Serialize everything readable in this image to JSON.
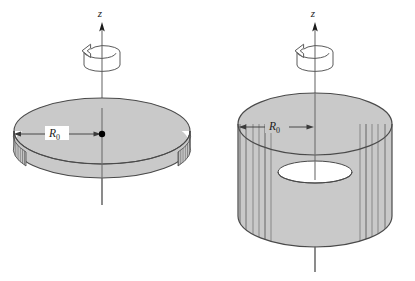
{
  "figure": {
    "kind": "technical-line-diagram",
    "background_color": "#ffffff",
    "line_color": "#3a3a3a",
    "fill_color": "#c9c9c9",
    "fill_color_dark": "#b4b4b4",
    "fill_color_light": "#d6d6d6",
    "accent_color": "#000000",
    "panels": [
      {
        "id": "left",
        "name": "hoop",
        "object_label": "thin circular ring",
        "axis_label": "z",
        "radius_label": "R",
        "radius_subscript": "0",
        "rotation_arrow": "counterclockwise",
        "center_marker": "filled-dot",
        "surface_fill": "#c9c9c9"
      },
      {
        "id": "right",
        "name": "cylinder",
        "object_label": "hollow cylinder",
        "axis_label": "z",
        "radius_label": "R",
        "radius_subscript": "0",
        "rotation_arrow": "counterclockwise",
        "center_marker": "none",
        "surface_fill": "#c9c9c9"
      }
    ]
  }
}
